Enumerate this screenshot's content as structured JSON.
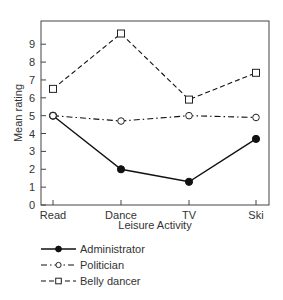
{
  "chart_data": {
    "type": "line",
    "title": "",
    "xlabel": "Leisure Activity",
    "ylabel": "Mean rating",
    "categories": [
      "Read",
      "Dance",
      "TV",
      "Ski"
    ],
    "ylim": [
      0,
      10.3
    ],
    "yticks": [
      0,
      1,
      2,
      3,
      4,
      5,
      6,
      7,
      8,
      9
    ],
    "grid": false,
    "legend_position": "bottom-left, below plot",
    "series": [
      {
        "name": "Administrator",
        "values": [
          5.0,
          2.0,
          1.3,
          3.7
        ],
        "line_style": "solid",
        "marker": "filled-circle",
        "color": "#111111"
      },
      {
        "name": "Politician",
        "values": [
          5.0,
          4.7,
          5.0,
          4.9
        ],
        "line_style": "dash-dot",
        "marker": "open-circle",
        "color": "#111111"
      },
      {
        "name": "Belly dancer",
        "values": [
          6.5,
          9.6,
          5.9,
          7.4
        ],
        "line_style": "dashed",
        "marker": "open-square",
        "color": "#111111"
      }
    ]
  },
  "layout": {
    "plot": {
      "left": 41,
      "top": 21,
      "right": 269,
      "bottom": 205
    },
    "x_positions": [
      53,
      121,
      189,
      256
    ]
  }
}
